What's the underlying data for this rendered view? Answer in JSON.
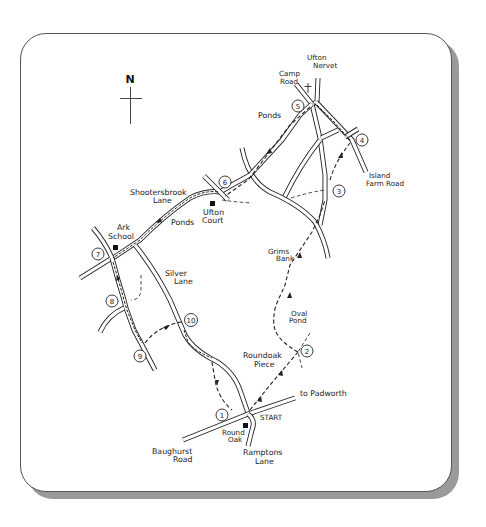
{
  "map": {
    "title": "Circular walk route map",
    "compass": {
      "label": "N"
    },
    "start_label": "START",
    "places": {
      "ufton_nervet": [
        "Ufton",
        "Nervet"
      ],
      "camp_road": [
        "Camp",
        "Road"
      ],
      "ponds_north": "Ponds",
      "island_farm_road": [
        "Island",
        "Farm Road"
      ],
      "shootersbrook_lane": [
        "Shootersbrook",
        "Lane"
      ],
      "ufton_court": [
        "Ufton",
        "Court"
      ],
      "ponds_west": "Ponds",
      "ark_school": [
        "Ark",
        "School"
      ],
      "silver_lane": [
        "Silver",
        "Lane"
      ],
      "grims_bank": [
        "Grims",
        "Bank"
      ],
      "oval_pond": [
        "Oval",
        "Pond"
      ],
      "roundoak_piece": [
        "Roundoak",
        "Piece"
      ],
      "to_padworth": "to Padworth",
      "round_oak": [
        "Round",
        "Oak"
      ],
      "baughurst_road": [
        "Baughurst",
        "Road"
      ],
      "ramptons_lane": [
        "Ramptons",
        "Lane"
      ]
    },
    "waypoints": [
      "1",
      "2",
      "3",
      "4",
      "5",
      "6",
      "7",
      "8",
      "9",
      "10"
    ],
    "colors": {
      "line": "#222222",
      "card": "#ffffff",
      "shadow": "#9a9a9a"
    }
  }
}
